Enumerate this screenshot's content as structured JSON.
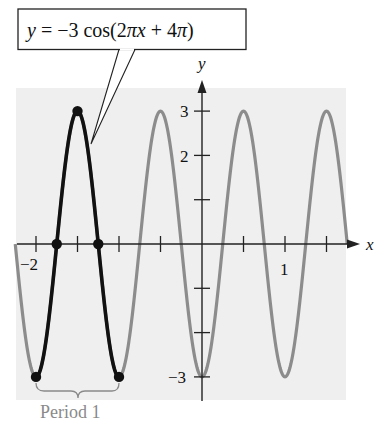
{
  "chart_data": {
    "type": "line",
    "title": "y = −3 cos(2πx + 4π)",
    "equation": "y = -3 cos(2*pi*x + 4*pi)",
    "xlabel": "x",
    "ylabel": "y",
    "xlim": [
      -2.25,
      1.75
    ],
    "ylim": [
      -3,
      3
    ],
    "x_ticks": [
      -2,
      -1.5,
      -1,
      -0.5,
      0,
      0.5,
      1,
      1.5
    ],
    "x_tick_labels": [
      {
        "value": -2,
        "label": "−2"
      },
      {
        "value": 1,
        "label": "1"
      }
    ],
    "y_ticks": [
      -3,
      -2,
      -1,
      1,
      2,
      3
    ],
    "y_tick_labels": [
      {
        "value": 3,
        "label": "3"
      },
      {
        "value": 2,
        "label": "2"
      },
      {
        "value": -3,
        "label": "−3"
      }
    ],
    "grid": false,
    "series": [
      {
        "name": "full curve",
        "color": "#8c8c8c",
        "x_range": [
          -2.25,
          1.75
        ],
        "amplitude": 3,
        "period": 1,
        "style": "gray"
      },
      {
        "name": "one period",
        "color": "#111111",
        "x_range": [
          -2,
          -1
        ],
        "style": "bold black",
        "key_points": [
          {
            "x": -2,
            "y": -3
          },
          {
            "x": -1.75,
            "y": 0
          },
          {
            "x": -1.5,
            "y": 3
          },
          {
            "x": -1.25,
            "y": 0
          },
          {
            "x": -1,
            "y": -3
          }
        ]
      }
    ],
    "annotations": [
      {
        "text": "Period 1",
        "spans_x": [
          -2,
          -1
        ],
        "type": "brace"
      },
      {
        "text": "y = −3 cos(2πx + 4π)",
        "type": "callout"
      }
    ]
  },
  "labels": {
    "callout": "y = −3 cos(2πx + 4π)",
    "callout_y": "y",
    "callout_rest": " = −3 cos(2",
    "callout_pi1": "π",
    "callout_x": "x",
    "callout_mid": " + 4",
    "callout_pi2": "π",
    "callout_close": ")",
    "period": "Period 1",
    "x_axis": "x",
    "y_axis": "y",
    "xtick_neg2": "−2",
    "xtick_1": "1",
    "ytick_3": "3",
    "ytick_2": "2",
    "ytick_neg3": "−3"
  },
  "colors": {
    "panel": "#efefef",
    "gray_curve": "#8c8c8c",
    "black_curve": "#111111",
    "axis": "#222222",
    "period_text": "#8a8a8a"
  }
}
